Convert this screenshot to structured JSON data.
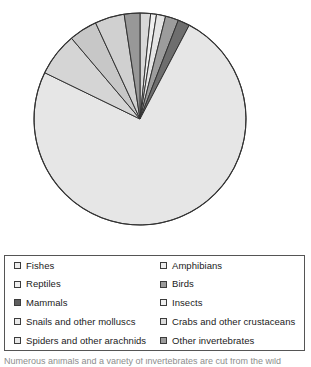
{
  "chart_data": {
    "type": "pie",
    "title": "",
    "xlabel": "",
    "ylabel": "",
    "start_angle_deg": 0,
    "direction": "clockwise",
    "center": {
      "x": 140,
      "y": 119
    },
    "radius": 106,
    "legend_position": "bottom",
    "grid": false,
    "categories": [
      "Fishes",
      "Amphibians",
      "Reptiles",
      "Birds",
      "Mammals",
      "Insects",
      "Snails and other molluscs",
      "Crabs and other crustaceans",
      "Spiders and other arachnids",
      "Other invertebrates"
    ],
    "values": [
      1.6,
      0.9,
      1.4,
      2.0,
      1.8,
      74.5,
      6.6,
      4.3,
      4.5,
      2.4
    ],
    "unit": "percent",
    "slices": [
      {
        "label": "Fishes",
        "value": 1.6,
        "color": "#d8d8d8",
        "start_deg": 0.0,
        "end_deg": 5.8
      },
      {
        "label": "Amphibians",
        "value": 0.9,
        "color": "#efefef",
        "start_deg": 5.8,
        "end_deg": 9.0
      },
      {
        "label": "Reptiles",
        "value": 1.4,
        "color": "#e4e4e4",
        "start_deg": 9.0,
        "end_deg": 14.0
      },
      {
        "label": "Birds",
        "value": 2.0,
        "color": "#9c9c9c",
        "start_deg": 14.0,
        "end_deg": 21.2
      },
      {
        "label": "Mammals",
        "value": 1.8,
        "color": "#6e6e6e",
        "start_deg": 21.2,
        "end_deg": 27.7
      },
      {
        "label": "Insects",
        "value": 74.5,
        "color": "#e6e6e6",
        "start_deg": 27.7,
        "end_deg": 295.9
      },
      {
        "label": "Snails and other molluscs",
        "value": 6.6,
        "color": "#d5d5d5",
        "start_deg": 295.9,
        "end_deg": 319.7
      },
      {
        "label": "Crabs and other crustaceans",
        "value": 4.3,
        "color": "#c7c7c7",
        "start_deg": 319.7,
        "end_deg": 335.2
      },
      {
        "label": "Spiders and other arachnids",
        "value": 4.5,
        "color": "#d0d0d0",
        "start_deg": 335.2,
        "end_deg": 351.4
      },
      {
        "label": "Other invertebrates",
        "value": 2.4,
        "color": "#989898",
        "start_deg": 351.4,
        "end_deg": 360.0
      }
    ],
    "slice_outline_color": "#333333"
  },
  "legend": {
    "rows": [
      {
        "left": {
          "label": "Fishes",
          "swatch": "#ededed"
        },
        "right": {
          "label": "Amphibians",
          "swatch": "#ededed"
        }
      },
      {
        "left": {
          "label": "Reptiles",
          "swatch": "#efefef"
        },
        "right": {
          "label": "Birds",
          "swatch": "#9a9a9a"
        }
      },
      {
        "left": {
          "label": "Mammals",
          "swatch": "#5e5e5e"
        },
        "right": {
          "label": "Insects",
          "swatch": "#f0f0f0"
        }
      },
      {
        "left": {
          "label": "Snails and other molluscs",
          "swatch": "#eaeaea"
        },
        "right": {
          "label": "Crabs and other crustaceans",
          "swatch": "#dcdcdc"
        }
      },
      {
        "left": {
          "label": "Spiders and other arachnids",
          "swatch": "#e8e8e8"
        },
        "right": {
          "label": "Other invertebrates",
          "swatch": "#9c9c9c"
        }
      }
    ],
    "border_color": "#555555"
  },
  "caption": {
    "text": "Numerous animals and a variety of invertebrates are cut from the wild"
  }
}
